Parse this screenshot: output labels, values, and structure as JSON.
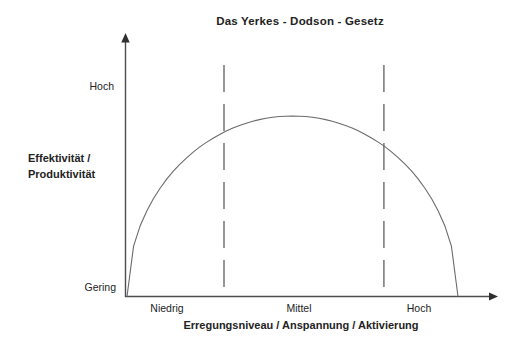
{
  "labels": {
    "ylabel_line1": "Effektivität /",
    "ylabel_line2": "Produktivität"
  },
  "colors": {
    "background": "#ffffff",
    "text": "#232323",
    "axis_line": "#4d4d50",
    "curve_line": "#6b6b6e",
    "dashed_line": "#6b6b6e"
  },
  "chart_data": {
    "type": "line",
    "title": "Das Yerkes - Dodson - Gesetz",
    "xlabel": "Erregungsniveau / Anspannung / Aktivierung",
    "ylabel": "Effektivität / Produktivität",
    "x_axis": {
      "type": "qualitative",
      "tick_labels": [
        "Niedrig",
        "Mittel",
        "Hoch"
      ],
      "range_normalized": [
        0,
        100
      ],
      "arrow": true
    },
    "y_axis": {
      "type": "qualitative",
      "tick_labels": [
        "Gering",
        "Hoch"
      ],
      "range_normalized": [
        0,
        100
      ],
      "arrow": true
    },
    "grid": false,
    "legend": false,
    "series": [
      {
        "name": "Effektivität / Produktivität (inverted-U curve)",
        "shape": "semi-ellipse",
        "points": [
          [
            0,
            0
          ],
          [
            2,
            28.0
          ],
          [
            4,
            39.2
          ],
          [
            6,
            47.5
          ],
          [
            8,
            54.3
          ],
          [
            10,
            60.0
          ],
          [
            12,
            65.0
          ],
          [
            14,
            69.4
          ],
          [
            16,
            73.3
          ],
          [
            18,
            76.8
          ],
          [
            20,
            80.0
          ],
          [
            22,
            82.9
          ],
          [
            24,
            85.4
          ],
          [
            26,
            87.7
          ],
          [
            28,
            89.8
          ],
          [
            30,
            91.7
          ],
          [
            32,
            93.3
          ],
          [
            34,
            94.7
          ],
          [
            36,
            96.0
          ],
          [
            38,
            97.1
          ],
          [
            40,
            98.0
          ],
          [
            42,
            98.7
          ],
          [
            44,
            99.3
          ],
          [
            46,
            99.7
          ],
          [
            48,
            99.9
          ],
          [
            50,
            100
          ],
          [
            52,
            99.9
          ],
          [
            54,
            99.7
          ],
          [
            56,
            99.3
          ],
          [
            58,
            98.7
          ],
          [
            60,
            98.0
          ],
          [
            62,
            97.1
          ],
          [
            64,
            96.0
          ],
          [
            66,
            94.7
          ],
          [
            68,
            93.3
          ],
          [
            70,
            91.7
          ],
          [
            72,
            89.8
          ],
          [
            74,
            87.7
          ],
          [
            76,
            85.4
          ],
          [
            78,
            82.9
          ],
          [
            80,
            80.0
          ],
          [
            82,
            76.8
          ],
          [
            84,
            73.3
          ],
          [
            86,
            69.4
          ],
          [
            88,
            65.0
          ],
          [
            90,
            60.0
          ],
          [
            92,
            54.3
          ],
          [
            94,
            47.5
          ],
          [
            96,
            39.2
          ],
          [
            98,
            28.0
          ],
          [
            100,
            0
          ]
        ]
      }
    ],
    "annotations": {
      "vertical_dashed_lines_x": [
        29.3,
        77.6
      ],
      "description": "Two dashed vertical lines split arousal level into Niedrig / Mittel / Hoch regions"
    }
  }
}
